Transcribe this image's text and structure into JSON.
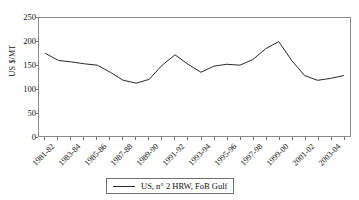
{
  "chart_data": {
    "type": "line",
    "title": "",
    "xlabel": "",
    "ylabel": "US $/MT",
    "ylim": [
      0,
      250
    ],
    "ytick_values": [
      0,
      50,
      100,
      150,
      200,
      250
    ],
    "ytick_labels": [
      "0",
      "50",
      "100",
      "150",
      "200",
      "250"
    ],
    "grid": false,
    "legend_position": "below-center",
    "categories": [
      "1981-82",
      "1982-83",
      "1983-84",
      "1984-85",
      "1985-86",
      "1986-87",
      "1987-88",
      "1988-89",
      "1989-90",
      "1990-91",
      "1991-92",
      "1992-93",
      "1993-94",
      "1994-95",
      "1995-96",
      "1996-97",
      "1997-98",
      "1998-99",
      "1999-00",
      "2000-01",
      "2001-02",
      "2002-03",
      "2003-04",
      "2004-05"
    ],
    "xtick_labels_shown": [
      "1981-82",
      "1983-84",
      "1985-86",
      "1987-88",
      "1989-90",
      "1991-92",
      "1993-94",
      "1995-96",
      "1997-98",
      "1999-00",
      "2001-02",
      "2003-04"
    ],
    "series": [
      {
        "name": "US, n° 2 HRW, FoB Gulf",
        "color": "#2a2a2a",
        "values": [
          175,
          160,
          157,
          153,
          150,
          135,
          118,
          112,
          120,
          150,
          172,
          152,
          135,
          148,
          152,
          150,
          162,
          185,
          200,
          160,
          128,
          118,
          122,
          128
        ]
      }
    ]
  },
  "legend": {
    "entries": [
      {
        "label": "US, n° 2 HRW, FoB Gulf"
      }
    ]
  }
}
